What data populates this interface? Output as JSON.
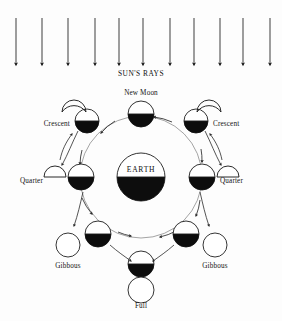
{
  "diagram": {
    "title_text": "SUN'S RAYS",
    "type": "moon-phases-orbit-diagram",
    "background_color": "#fdfdfd",
    "ink_color": "#111111",
    "light_color": "#ffffff",
    "dark_color": "#0d0d0d",
    "sun_rays": {
      "label": "SUN'S RAYS",
      "label_x": 141,
      "label_y": 76,
      "count": 11,
      "direction": "downward",
      "y_top": 18,
      "y_tip": 65,
      "x_positions": [
        16,
        42,
        68,
        95,
        119,
        143,
        170,
        194,
        220,
        243,
        270
      ]
    },
    "earth": {
      "label": "EARTH",
      "cx": 141,
      "cy": 177,
      "r": 24,
      "lit_half": "top",
      "dark_half": "bottom"
    },
    "orbit": {
      "cx": 141,
      "cy": 177,
      "r": 61,
      "direction": "counterclockwise"
    },
    "moon_positions": [
      {
        "id": "new-moon",
        "label": "New Moon",
        "label_x": 141,
        "label_y": 92,
        "cx": 141,
        "cy": 114,
        "r": 13,
        "lit_half": "top",
        "dark_half": "bottom",
        "phase_shape": "none",
        "phase_shape_note": "no appearance glyph; moon is invisible from Earth"
      },
      {
        "id": "crescent-left",
        "label": "Crescent",
        "label_x": 52,
        "label_y": 126,
        "cx": 87,
        "cy": 121,
        "r": 12,
        "lit_half": "top",
        "dark_half": "bottom",
        "phase_shape": "crescent",
        "phase_cx": 74,
        "phase_cy": 107
      },
      {
        "id": "crescent-right",
        "label": "Crescent",
        "label_x": 232,
        "label_y": 126,
        "cx": 196,
        "cy": 121,
        "r": 12,
        "lit_half": "top",
        "dark_half": "bottom",
        "phase_shape": "crescent",
        "phase_cx": 209,
        "phase_cy": 107
      },
      {
        "id": "quarter-left",
        "label": "Quarter",
        "label_x": 43,
        "label_y": 183,
        "cx": 81,
        "cy": 177,
        "r": 13,
        "lit_half": "top",
        "dark_half": "bottom",
        "phase_shape": "half-dome",
        "phase_cx": 55,
        "phase_cy": 176
      },
      {
        "id": "quarter-right",
        "label": "Quarter",
        "label_x": 241,
        "label_y": 183,
        "cx": 202,
        "cy": 177,
        "r": 13,
        "lit_half": "top",
        "dark_half": "bottom",
        "phase_shape": "half-dome",
        "phase_cx": 228,
        "phase_cy": 176
      },
      {
        "id": "gibbous-left",
        "label": "Gibbous",
        "label_x": 63,
        "label_y": 268,
        "cx": 98,
        "cy": 234,
        "r": 13,
        "lit_half": "top",
        "dark_half": "bottom",
        "phase_shape": "full-circle",
        "phase_cx": 68,
        "phase_cy": 245
      },
      {
        "id": "gibbous-right",
        "label": "Gibbous",
        "label_x": 216,
        "label_y": 268,
        "cx": 186,
        "cy": 234,
        "r": 13,
        "lit_half": "top",
        "dark_half": "bottom",
        "phase_shape": "full-circle",
        "phase_cx": 215,
        "phase_cy": 245
      },
      {
        "id": "full-moon",
        "label": "Full",
        "label_x": 141,
        "label_y": 305,
        "cx": 141,
        "cy": 264,
        "r": 13,
        "lit_half": "top",
        "dark_half": "bottom",
        "phase_shape": "full-circle",
        "phase_cx": 141,
        "phase_cy": 290
      }
    ],
    "orbit_arrow_count": 8
  }
}
